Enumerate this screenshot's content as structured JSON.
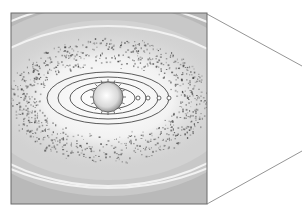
{
  "figure": {
    "frame": {
      "x": 11,
      "y": 13,
      "width": 196,
      "height": 191,
      "stroke": "#6b6b6b"
    },
    "callout": {
      "top": {
        "x1": 207,
        "y1": 14,
        "x2": 302,
        "y2": 66
      },
      "bottom": {
        "x1": 207,
        "y1": 204,
        "x2": 302,
        "y2": 151
      },
      "stroke": "#7a7a7a"
    },
    "background_color": "#b9b9b9",
    "inner_glow_color": "#f4f4f4",
    "star": {
      "cx": 108,
      "cy": 97,
      "r": 15,
      "spikes": 16,
      "fill": "#e8e8e8",
      "stroke": "#555555"
    },
    "orbits": [
      {
        "rx": 27,
        "ry": 11
      },
      {
        "rx": 38,
        "ry": 16
      },
      {
        "rx": 50,
        "ry": 21
      },
      {
        "rx": 61,
        "ry": 26
      }
    ],
    "orbit_center": {
      "cx": 108,
      "cy": 98
    },
    "planets": [
      {
        "cx": 138,
        "cy": 98,
        "r": 2
      },
      {
        "cx": 148,
        "cy": 98,
        "r": 2
      },
      {
        "cx": 159,
        "cy": 98,
        "r": 2
      },
      {
        "cx": 169,
        "cy": 98,
        "r": 2
      }
    ],
    "outer_bands": [
      {
        "cy": 150,
        "rx": 230,
        "ry": 128
      },
      {
        "cy": 140,
        "rx": 220,
        "ry": 105
      }
    ],
    "debris_ring": {
      "cx": 108,
      "cy": 100,
      "rx_inner": 70,
      "ry_inner": 35,
      "rx_outer": 100,
      "ry_outer": 62,
      "count": 900,
      "color": "#6a6a6a"
    }
  }
}
